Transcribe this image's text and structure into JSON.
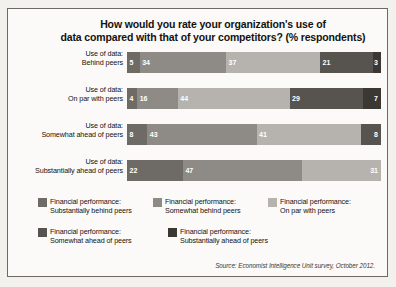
{
  "figure": {
    "title_line1": "How would you rate your organization's use of",
    "title_line2": "data compared with that of your competitors? (% respondents)",
    "source": "Source: Economist Intelligence Unit survey, October 2012."
  },
  "chart_data": {
    "type": "bar",
    "orientation": "horizontal",
    "stacked": true,
    "title": "How would you rate your organization's use of data compared with that of your competitors? (% respondents)",
    "xlabel": "",
    "ylabel": "",
    "xlim": [
      0,
      100
    ],
    "grid": false,
    "legend_position": "bottom",
    "categories": [
      "Use of data: Behind peers",
      "Use of data: On par with peers",
      "Use of data: Somewhat ahead of peers",
      "Use of data: Substantially ahead of peers"
    ],
    "category_lines": [
      [
        "Use of data:",
        "Behind peers"
      ],
      [
        "Use of data:",
        "On par with peers"
      ],
      [
        "Use of data:",
        "Somewhat ahead of peers"
      ],
      [
        "Use of data:",
        "Substantially ahead of peers"
      ]
    ],
    "series": [
      {
        "name": "Financial performance: Substantially behind peers",
        "name_lines": [
          "Financial performance:",
          "Substantially behind peers"
        ],
        "color": "#6e6b67",
        "values": [
          5,
          4,
          8,
          22
        ]
      },
      {
        "name": "Financial performance: Somewhat behind peers",
        "name_lines": [
          "Financial performance:",
          "Somewhat behind peers"
        ],
        "color": "#8e8b87",
        "values": [
          34,
          16,
          43,
          47
        ]
      },
      {
        "name": "Financial performance: On par with peers",
        "name_lines": [
          "Financial performance:",
          "On par with peers"
        ],
        "color": "#b6b3ae",
        "values": [
          37,
          44,
          41,
          31
        ]
      },
      {
        "name": "Financial performance: Somewhat ahead of peers",
        "name_lines": [
          "Financial performance:",
          "Somewhat ahead of peers"
        ],
        "color": "#57544f",
        "values": [
          21,
          29,
          8,
          0
        ]
      },
      {
        "name": "Financial performance: Substantially ahead of peers",
        "name_lines": [
          "Financial performance:",
          "Substantially ahead of peers"
        ],
        "color": "#3b3834",
        "values": [
          3,
          7,
          0,
          0
        ]
      }
    ]
  },
  "bars": [
    {
      "label_line1": "Use of data:",
      "label_line2": "Behind peers",
      "segments": [
        {
          "value": 5,
          "label": "5",
          "color": "#6e6b67"
        },
        {
          "value": 34,
          "label": "34",
          "color": "#8e8b87"
        },
        {
          "value": 37,
          "label": "37",
          "color": "#b6b3ae"
        },
        {
          "value": 21,
          "label": "21",
          "color": "#57544f"
        },
        {
          "value": 3,
          "label": "3",
          "color": "#3b3834"
        }
      ]
    },
    {
      "label_line1": "Use of data:",
      "label_line2": "On par with peers",
      "segments": [
        {
          "value": 4,
          "label": "4",
          "color": "#6e6b67"
        },
        {
          "value": 16,
          "label": "16",
          "color": "#8e8b87"
        },
        {
          "value": 44,
          "label": "44",
          "color": "#b6b3ae"
        },
        {
          "value": 29,
          "label": "29",
          "color": "#57544f"
        },
        {
          "value": 7,
          "label": "7",
          "color": "#3b3834"
        }
      ]
    },
    {
      "label_line1": "Use of data:",
      "label_line2": "Somewhat ahead of peers",
      "segments": [
        {
          "value": 8,
          "label": "8",
          "color": "#6e6b67"
        },
        {
          "value": 43,
          "label": "43",
          "color": "#8e8b87"
        },
        {
          "value": 41,
          "label": "41",
          "color": "#b6b3ae"
        },
        {
          "value": 8,
          "label": "8",
          "color": "#57544f"
        }
      ]
    },
    {
      "label_line1": "Use of data:",
      "label_line2": "Substantially ahead of peers",
      "segments": [
        {
          "value": 22,
          "label": "22",
          "color": "#6e6b67"
        },
        {
          "value": 47,
          "label": "47",
          "color": "#8e8b87"
        },
        {
          "value": 31,
          "label": "31",
          "color": "#b6b3ae"
        }
      ]
    }
  ],
  "legend": {
    "row1": [
      {
        "color": "#6e6b67",
        "line1": "Financial performance:",
        "line2": "Substantially behind peers"
      },
      {
        "color": "#8e8b87",
        "line1": "Financial performance:",
        "line2": "Somewhat behind peers"
      },
      {
        "color": "#b6b3ae",
        "line1": "Financial performance:",
        "line2": "On par with peers"
      }
    ],
    "row2": [
      {
        "color": "#57544f",
        "line1": "Financial performance:",
        "line2": "Somewhat ahead of peers"
      },
      {
        "color": "#3b3834",
        "line1": "Financial performance:",
        "line2": "Substantially ahead of peers"
      }
    ]
  }
}
